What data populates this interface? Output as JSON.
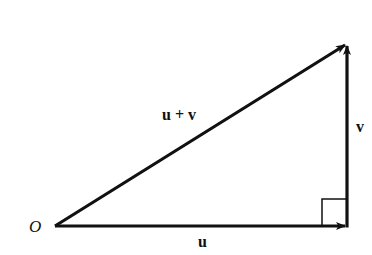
{
  "diagram": {
    "colors": {
      "stroke": "#111111",
      "background": "#ffffff"
    },
    "points": {
      "origin": {
        "x": 55,
        "y": 226
      },
      "u_end": {
        "x": 347,
        "y": 226
      },
      "sum_end": {
        "x": 347,
        "y": 44
      }
    },
    "labels": {
      "origin": "O",
      "u": "u",
      "v": "v",
      "sum": "u + v"
    },
    "vectors": [
      {
        "name": "u",
        "from": "origin",
        "to": "u_end"
      },
      {
        "name": "v",
        "from": "u_end",
        "to": "sum_end"
      },
      {
        "name": "u + v",
        "from": "origin",
        "to": "sum_end"
      }
    ],
    "right_angle_marker": {
      "at": "u_end",
      "size": 25
    }
  }
}
